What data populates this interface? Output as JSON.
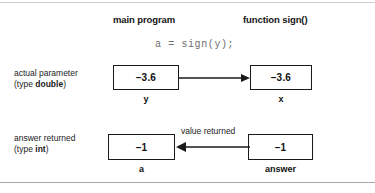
{
  "figure": {
    "code_line": "a = sign(y);",
    "columns": {
      "main_program": "main program",
      "function": "function sign()"
    },
    "row_labels": {
      "actual_parameter": "actual parameter",
      "actual_parameter_type_prefix": "(type ",
      "actual_parameter_type": "double",
      "actual_parameter_type_suffix": ")",
      "answer_returned": "answer returned",
      "answer_returned_type_prefix": "(type ",
      "answer_returned_type": "int",
      "answer_returned_type_suffix": ")"
    },
    "boxes": {
      "y": {
        "value": "–3.6",
        "name": "y"
      },
      "x": {
        "value": "–3.6",
        "name": "x"
      },
      "a": {
        "value": "–1",
        "name": "a"
      },
      "answer": {
        "value": "–1",
        "name": "answer"
      }
    },
    "arrows": {
      "parameter_pass": {
        "label": "",
        "direction": "right"
      },
      "value_returned": {
        "label": "value returned",
        "direction": "left"
      }
    },
    "colors": {
      "ink": "#1a1a1a",
      "code_text": "#6e6e6e",
      "rule": "#b9b9b9",
      "background": "#ffffff"
    }
  }
}
